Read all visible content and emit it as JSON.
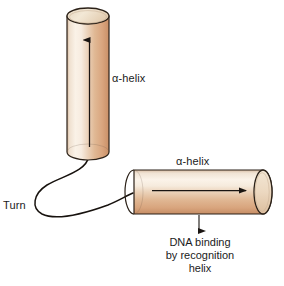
{
  "figure": {
    "width": 284,
    "height": 286,
    "background_color": "#ffffff"
  },
  "labels": {
    "alpha_helix_vertical": "α-helix",
    "alpha_helix_horizontal": "α-helix",
    "turn": "Turn"
  },
  "caption": {
    "line1": "DNA binding",
    "line2": "by recognition",
    "line3": "helix"
  },
  "colors": {
    "cylinder_light": "#faf1e6",
    "cylinder_mid": "#e8c0a0",
    "cylinder_dark": "#d09a72",
    "cylinder_shadow": "#b9825c",
    "outline": "#2b2118",
    "cap_fill": "#ede0cd",
    "text": "#1b1b1b",
    "arrow": "#1a1512",
    "loop": "#17120e"
  },
  "elements": {
    "vertical_helix": {
      "name": "alpha-helix-cylinder-vertical",
      "x": 67,
      "y": 8,
      "width": 42,
      "height": 152,
      "orientation": "vertical",
      "arrow_direction": "up"
    },
    "horizontal_helix": {
      "name": "alpha-helix-cylinder-horizontal",
      "x": 126,
      "y": 170,
      "width": 146,
      "height": 44,
      "orientation": "horizontal",
      "arrow_direction": "right"
    },
    "turn_loop": {
      "name": "turn-loop-connector",
      "description": "curved backbone loop connecting the two helices"
    },
    "binding_arrow": {
      "name": "dna-binding-arrow",
      "direction": "down",
      "x": 199,
      "y_start": 214,
      "y_end": 234
    }
  }
}
